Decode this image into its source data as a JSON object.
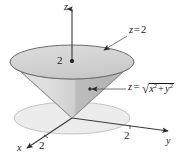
{
  "figure": {
    "kind": "3d-cone-with-capping-plane",
    "axes": {
      "z_label": "z",
      "y_label": "y",
      "x_label": "x",
      "z_tick_label": "2",
      "y_tick_label": "2",
      "x_tick_label": "2"
    },
    "annotations": {
      "plane": {
        "var": "z",
        "eq": "=",
        "value": "2",
        "full_text": "z = 2"
      },
      "cone": {
        "var": "z",
        "eq": "=",
        "radical_sign": "√",
        "term_x": "x",
        "exp_x": "2",
        "plus": "+",
        "term_y": "y",
        "exp_y": "2",
        "full_text": "z = √(x² + y²)"
      }
    },
    "colors": {
      "top_disk_fill": "#d5d5d5",
      "top_disk_stroke": "#5a5a5a",
      "cone_left_fill": "#dedede",
      "cone_right_fill": "#b9b9b9",
      "ground_disk_fill": "#ececec",
      "ground_disk_stroke": "#b0b0b0",
      "axis_stroke": "#3a3a3a",
      "text": "#1a1a1a",
      "background": "#ffffff"
    },
    "geometry": {
      "origin": [
        72,
        118
      ],
      "top_disk_center": [
        72,
        62
      ],
      "top_disk_rx": 62,
      "top_disk_ry": 17,
      "ground_disk_center": [
        72,
        118
      ],
      "ground_disk_rx": 58,
      "ground_disk_ry": 16
    }
  }
}
